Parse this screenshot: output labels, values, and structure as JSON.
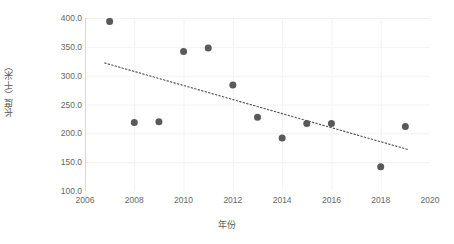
{
  "chart_data": {
    "type": "scatter",
    "title": "",
    "xlabel": "年份",
    "ylabel": "长度（千米）",
    "xlim": [
      2006,
      2020
    ],
    "ylim": [
      100.0,
      400.0
    ],
    "grid": true,
    "legend": "none",
    "x_ticks": [
      "2006",
      "2008",
      "2010",
      "2012",
      "2014",
      "2016",
      "2018",
      "2020"
    ],
    "x_tick_values": [
      2006,
      2008,
      2010,
      2012,
      2014,
      2016,
      2018,
      2020
    ],
    "y_ticks": [
      "100.0",
      "150.0",
      "200.0",
      "250.0",
      "300.0",
      "350.0",
      "400.0"
    ],
    "y_tick_values": [
      100.0,
      150.0,
      200.0,
      250.0,
      300.0,
      350.0,
      400.0
    ],
    "x": [
      2007,
      2008,
      2009,
      2010,
      2011,
      2012,
      2013,
      2014,
      2015,
      2016,
      2018,
      2019
    ],
    "values": [
      394,
      219,
      220,
      342,
      348,
      284,
      228,
      192,
      217,
      217,
      142,
      212
    ],
    "points": [
      {
        "x": 2007,
        "y": 394
      },
      {
        "x": 2008,
        "y": 219
      },
      {
        "x": 2009,
        "y": 220
      },
      {
        "x": 2010,
        "y": 342
      },
      {
        "x": 2011,
        "y": 348
      },
      {
        "x": 2012,
        "y": 284
      },
      {
        "x": 2013,
        "y": 228
      },
      {
        "x": 2014,
        "y": 192
      },
      {
        "x": 2015,
        "y": 217
      },
      {
        "x": 2016,
        "y": 217
      },
      {
        "x": 2018,
        "y": 142
      },
      {
        "x": 2019,
        "y": 212
      }
    ],
    "trendline": {
      "type": "linear",
      "x_start": 2006.8,
      "y_start": 322,
      "x_end": 2019.1,
      "y_end": 172,
      "style": "dotted"
    },
    "marker": {
      "shape": "circle",
      "size": 7,
      "color": "#595959"
    },
    "colors": {
      "point": "#595959",
      "trendline": "#4d4d4d",
      "gridline": "#f2f2f2",
      "axis": "#d9d9d9",
      "tick_text": "#666666",
      "title_text": "#5a5a5a",
      "background": "#ffffff"
    }
  }
}
